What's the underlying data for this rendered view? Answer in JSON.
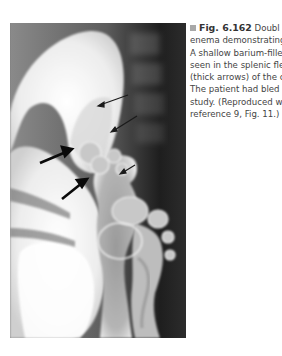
{
  "figure": {
    "type": "double-contrast barium enema radiograph",
    "arrows": {
      "thin": 3,
      "thick": 2
    }
  },
  "caption": {
    "label": "Fig. 6.162",
    "lines": [
      "Doubl",
      "enema demonstrating",
      "A shallow barium-fillec",
      "seen in the splenic fle",
      "(thick arrows) of the c",
      "The patient had bled",
      "study. (Reproduced w",
      "reference 9, Fig. 11.)"
    ]
  },
  "colors": {
    "bullet": "#a8a8a8",
    "text": "#444444"
  }
}
